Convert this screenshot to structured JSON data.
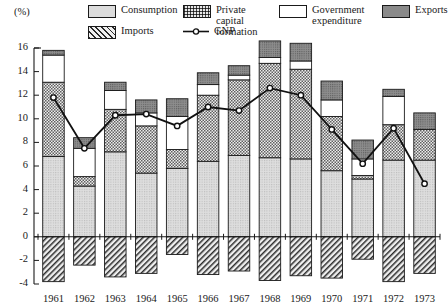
{
  "axis": {
    "unit_label": "(%)",
    "y_ticks": [
      16,
      14,
      12,
      10,
      8,
      6,
      4,
      2,
      0,
      -2,
      -4
    ],
    "y_min": -4,
    "y_max": 16,
    "x_ticks": [
      "1961",
      "1962",
      "1963",
      "1964",
      "1965",
      "1966",
      "1967",
      "1968",
      "1969",
      "1970",
      "1971",
      "1972",
      "1973"
    ]
  },
  "legend": {
    "items": [
      {
        "key": "consumption",
        "label": "Consumption",
        "icon": "consumption-swatch"
      },
      {
        "key": "private",
        "label": "Private capital\nformation",
        "icon": "private-capital-swatch"
      },
      {
        "key": "government",
        "label": "Government\nexpenditure",
        "icon": "government-swatch"
      },
      {
        "key": "exports",
        "label": "Exports",
        "icon": "exports-swatch"
      },
      {
        "key": "imports",
        "label": "Imports",
        "icon": "imports-swatch"
      },
      {
        "key": "gnp",
        "label": "GNP",
        "icon": "gnp-line-marker"
      }
    ]
  },
  "colors": {
    "consumption": "#dcdcdc",
    "private_capital": "#c9c9c9",
    "government": "#ffffff",
    "exports": "#8a8a8a",
    "imports": "#e8e8e8",
    "gnp_line": "#111111",
    "axis": "#1a1a1a"
  },
  "chart_data": {
    "type": "bar",
    "title": "",
    "subtitle": "",
    "xlabel": "",
    "ylabel": "(%)",
    "ylim": [
      -4,
      16
    ],
    "grid": false,
    "stacked": true,
    "legend_position": "top",
    "categories": [
      "1961",
      "1962",
      "1963",
      "1964",
      "1965",
      "1966",
      "1967",
      "1968",
      "1969",
      "1970",
      "1971",
      "1972",
      "1973"
    ],
    "series": [
      {
        "name": "Consumption",
        "values": [
          6.8,
          4.3,
          7.2,
          5.4,
          5.8,
          6.4,
          6.9,
          6.7,
          6.6,
          5.6,
          4.9,
          6.5,
          6.5
        ]
      },
      {
        "name": "Private capital formation",
        "values": [
          6.3,
          0.8,
          3.6,
          4.0,
          1.6,
          5.6,
          6.4,
          8.0,
          7.6,
          4.6,
          0.3,
          3.0,
          2.6
        ]
      },
      {
        "name": "Government expenditure",
        "values": [
          2.3,
          2.4,
          1.6,
          1.1,
          2.8,
          0.9,
          0.4,
          0.5,
          0.7,
          1.4,
          1.4,
          2.4,
          0.0
        ]
      },
      {
        "name": "Exports",
        "values": [
          0.4,
          0.9,
          0.7,
          1.1,
          1.5,
          1.0,
          0.8,
          1.4,
          1.5,
          1.6,
          1.6,
          0.6,
          1.4
        ]
      },
      {
        "name": "Imports",
        "values": [
          -3.8,
          -2.4,
          -3.4,
          -3.1,
          -1.5,
          -3.2,
          -2.9,
          -3.7,
          -3.3,
          -3.5,
          -1.9,
          -3.8,
          -3.1
        ]
      }
    ],
    "gnp": {
      "name": "GNP",
      "values": [
        11.8,
        7.5,
        10.3,
        10.4,
        9.4,
        11.0,
        10.7,
        12.6,
        12.0,
        9.1,
        6.2,
        9.2,
        4.5
      ]
    }
  }
}
